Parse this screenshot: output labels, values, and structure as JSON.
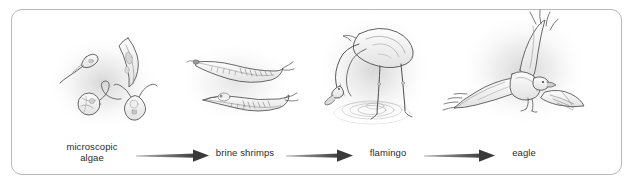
{
  "figure": {
    "background_color": "#ffffff",
    "frame_color": "#b9b9b9",
    "ink_color": "#4a4a4a",
    "label_color": "#2b2b2b"
  },
  "chain": {
    "steps": [
      {
        "id": "algae",
        "label": "microscopic\nalgae",
        "illustration": "microscopic-algae-cluster"
      },
      {
        "id": "shrimp",
        "label": "brine shrimps",
        "illustration": "brine-shrimps-pair"
      },
      {
        "id": "flamingo",
        "label": "flamingo",
        "illustration": "flamingo-feeding"
      },
      {
        "id": "eagle",
        "label": "eagle",
        "illustration": "eagle-in-flight"
      }
    ],
    "arrows": [
      {
        "id": "arrow-algae-to-shrimp",
        "from": "algae",
        "to": "shrimp",
        "glyph": "right-arrow"
      },
      {
        "id": "arrow-shrimp-to-flamingo",
        "from": "shrimp",
        "to": "flamingo",
        "glyph": "right-arrow"
      },
      {
        "id": "arrow-flamingo-to-eagle",
        "from": "flamingo",
        "to": "eagle",
        "glyph": "right-arrow"
      }
    ]
  }
}
